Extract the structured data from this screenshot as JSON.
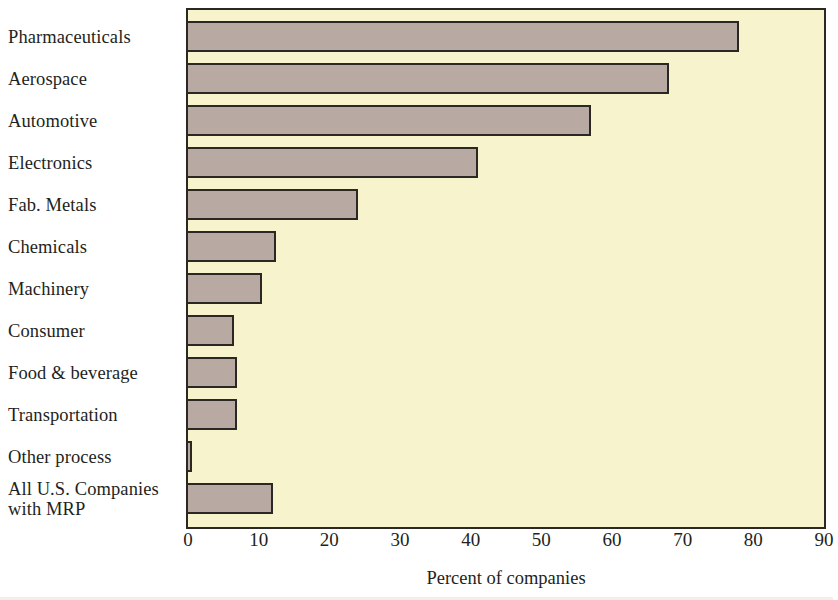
{
  "chart_data": {
    "type": "bar",
    "orientation": "horizontal",
    "title": "",
    "subtitle": "",
    "xlabel": "Percent of companies",
    "ylabel": "",
    "xlim": [
      0,
      90
    ],
    "xticks": [
      0,
      10,
      20,
      30,
      40,
      50,
      60,
      70,
      80,
      90
    ],
    "xtick_labels": [
      "0",
      "10",
      "20",
      "30",
      "40",
      "50",
      "60",
      "70",
      "80",
      "90"
    ],
    "grid": false,
    "legend": null,
    "categories": [
      "Pharmaceuticals",
      "Aerospace",
      "Automotive",
      "Electronics",
      "Fab. Metals",
      "Chemicals",
      "Machinery",
      "Consumer",
      "Food & beverage",
      "Transportation",
      "Other process",
      "All U.S. Companies\nwith MRP"
    ],
    "values": [
      78,
      68,
      57,
      41,
      24,
      12.5,
      10.5,
      6.5,
      7,
      7,
      0.6,
      12
    ],
    "series": [
      {
        "name": "Percent of companies",
        "values": [
          78,
          68,
          57,
          41,
          24,
          12.5,
          10.5,
          6.5,
          7,
          7,
          0.6,
          12
        ]
      }
    ],
    "colors": {
      "bar_fill": "#b9a9a3",
      "bar_edge": "#2b2722",
      "plot_background": "#f7f3cd",
      "figure_background": "#ffffff",
      "text": "#231f1c"
    }
  }
}
